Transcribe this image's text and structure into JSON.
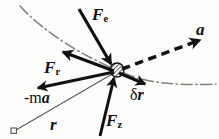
{
  "figure": {
    "background_color": "#fdfdfc",
    "ink_color": "#111111",
    "trajectory_color": "#7a7a72",
    "width": 219,
    "height": 139
  },
  "particle": {
    "name": "particle",
    "x": 117,
    "y": 70,
    "radius": 7,
    "fill": "hatched"
  },
  "origin": {
    "name": "origin-marker",
    "x": 14,
    "y": 131,
    "size": 5,
    "shape": "square"
  },
  "labels": {
    "force_applied": {
      "base": "F",
      "sub": "e"
    },
    "force_reaction": {
      "base": "F",
      "sub": "r"
    },
    "inertial_force": {
      "prefix": "-m",
      "base": "a"
    },
    "virtual_displacement": {
      "prefix": "δ",
      "base": "r"
    },
    "force_constraint": {
      "base": "F",
      "sub": "z"
    },
    "acceleration": {
      "base": "a"
    },
    "position_vector": {
      "base": "r"
    }
  },
  "vectors": [
    {
      "id": "Fe",
      "label": "F_e",
      "style": "solid-arrow",
      "from": {
        "x": 80,
        "y": 11
      },
      "to": {
        "x": 113,
        "y": 66
      },
      "width": 3.4,
      "head": "filled"
    },
    {
      "id": "Fr",
      "label": "F_r",
      "style": "solid-arrow",
      "from": {
        "x": 112,
        "y": 71
      },
      "to": {
        "x": 61,
        "y": 52
      },
      "width": 3.4,
      "head": "filled"
    },
    {
      "id": "minus-ma",
      "label": "-m a",
      "style": "solid-arrow",
      "from": {
        "x": 112,
        "y": 72
      },
      "to": {
        "x": 36,
        "y": 88
      },
      "width": 3.0,
      "head": "filled"
    },
    {
      "id": "delta-r",
      "label": "delta r",
      "style": "solid-arrow",
      "from": {
        "x": 118,
        "y": 73
      },
      "to": {
        "x": 146,
        "y": 85
      },
      "width": 3.0,
      "head": "filled"
    },
    {
      "id": "Fz",
      "label": "F_z",
      "style": "solid-arrow",
      "from": {
        "x": 101,
        "y": 134
      },
      "to": {
        "x": 115,
        "y": 76
      },
      "width": 3.0,
      "head": "filled"
    },
    {
      "id": "a",
      "label": "a",
      "style": "dashed-arrow",
      "from": {
        "x": 122,
        "y": 69
      },
      "to": {
        "x": 203,
        "y": 39
      },
      "width": 3.6,
      "head": "filled"
    },
    {
      "id": "r",
      "label": "r",
      "style": "thin-line",
      "from": {
        "x": 16,
        "y": 130
      },
      "to": {
        "x": 114,
        "y": 73
      },
      "width": 1.0,
      "head": "none"
    }
  ],
  "trajectory": {
    "name": "trajectory-curve",
    "style": "dash-dot",
    "description": "Curved path of the particle passing through the particle position"
  }
}
